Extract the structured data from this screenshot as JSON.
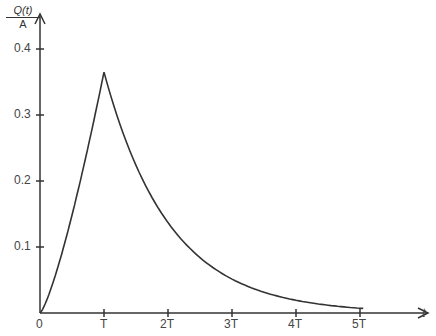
{
  "chart_data": {
    "type": "line",
    "title": "",
    "xlabel": "t",
    "ylabel": "Q(t)/A",
    "ylabel_numerator": "Q(t)",
    "ylabel_denominator": "A",
    "x_ticks": [
      "0",
      "T",
      "2T",
      "3T",
      "4T",
      "5T"
    ],
    "y_ticks": [
      "0.1",
      "0.2",
      "0.3",
      "0.4"
    ],
    "xlim": [
      0,
      5.8
    ],
    "ylim": [
      0,
      0.45
    ],
    "grid": false,
    "series": [
      {
        "name": "Q(t)/A",
        "x": [
          0,
          0.25,
          0.5,
          0.75,
          1.0,
          1.25,
          1.5,
          2.0,
          2.5,
          3.0,
          3.5,
          4.0,
          4.5,
          5.0
        ],
        "values": [
          0,
          0.06,
          0.14,
          0.24,
          0.365,
          0.29,
          0.225,
          0.15,
          0.1,
          0.065,
          0.04,
          0.025,
          0.015,
          0.007
        ]
      }
    ]
  }
}
